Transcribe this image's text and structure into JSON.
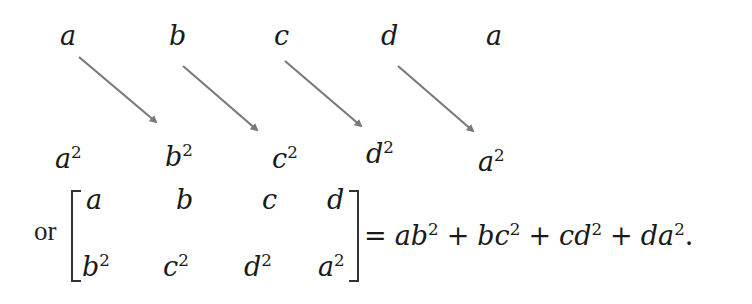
{
  "diagram": {
    "top_row": [
      {
        "label": "a"
      },
      {
        "label": "b"
      },
      {
        "label": "c"
      },
      {
        "label": "d"
      },
      {
        "label": "a"
      }
    ],
    "bottom_row": [
      {
        "base": "a",
        "exp": "2"
      },
      {
        "base": "b",
        "exp": "2"
      },
      {
        "base": "c",
        "exp": "2"
      },
      {
        "base": "d",
        "exp": "2"
      },
      {
        "base": "a",
        "exp": "2"
      }
    ],
    "arrows": [
      {
        "from": "a",
        "to": "b²"
      },
      {
        "from": "b",
        "to": "c²"
      },
      {
        "from": "c",
        "to": "d²"
      },
      {
        "from": "d",
        "to": "a²"
      }
    ],
    "arrow_color": "#7a7a7a"
  },
  "matrix": {
    "prefix": "or",
    "row1": [
      "a",
      "b",
      "c",
      "d"
    ],
    "row2": [
      {
        "base": "b",
        "exp": "2"
      },
      {
        "base": "c",
        "exp": "2"
      },
      {
        "base": "d",
        "exp": "2"
      },
      {
        "base": "a",
        "exp": "2"
      }
    ]
  },
  "equation": {
    "equals": "=",
    "terms": [
      {
        "coef": "a",
        "base": "b",
        "exp": "2"
      },
      {
        "coef": "b",
        "base": "c",
        "exp": "2"
      },
      {
        "coef": "c",
        "base": "d",
        "exp": "2"
      },
      {
        "coef": "d",
        "base": "a",
        "exp": "2"
      }
    ],
    "plus": "+",
    "terminator": "."
  }
}
